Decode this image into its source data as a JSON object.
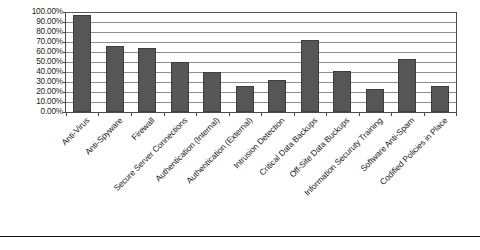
{
  "chart_data": {
    "type": "bar",
    "title": "",
    "subtitle": "",
    "xlabel": "",
    "ylabel": "",
    "ylim": [
      0,
      100
    ],
    "grid": true,
    "legend": "none",
    "orientation": "vertical",
    "bar_color": "#565656",
    "axis_color": "#4a4a4a",
    "grid_color": "#8d8d8d",
    "value_unit": "%",
    "ytick_labels": [
      "100.00%",
      "90.00%",
      "80.00%",
      "70.00%",
      "60.00%",
      "50.00%",
      "40.00%",
      "30.00%",
      "20.00%",
      "10.00%",
      "0.00%"
    ],
    "ytick_values": [
      100,
      90,
      80,
      70,
      60,
      50,
      40,
      30,
      20,
      10,
      0
    ],
    "categories": [
      "Anti-Virus",
      "Anti-Spyware",
      "Firewall",
      "Secure Server Connections",
      "Authentication (Internal)",
      "Authentication (External)",
      "Intrusion Detection",
      "Critical Data Backups",
      "Off-Site Data Buckups",
      "Information Securuty Training",
      "Software Anti-Spam",
      "Codified Policies in Place"
    ],
    "values": [
      97,
      66,
      64,
      50,
      40,
      26,
      32,
      72,
      41,
      23,
      53,
      26
    ]
  }
}
